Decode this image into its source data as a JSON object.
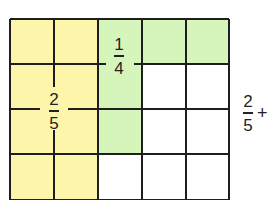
{
  "diagram": {
    "grid": {
      "rows": 4,
      "cols": 5
    },
    "colors": {
      "yellow": "#fdf6aa",
      "green": "#d6f5bb",
      "white": "#ffffff",
      "line": "#1e1e1e"
    },
    "shading": [
      [
        "yellow",
        "yellow",
        "green",
        "green",
        "green"
      ],
      [
        "yellow",
        "yellow",
        "green",
        "white",
        "white"
      ],
      [
        "yellow",
        "yellow",
        "green",
        "white",
        "white"
      ],
      [
        "yellow",
        "yellow",
        "white",
        "white",
        "white"
      ]
    ],
    "labels": {
      "quarter": {
        "numerator": "1",
        "denominator": "4"
      },
      "two_fifths": {
        "numerator": "2",
        "denominator": "5"
      }
    },
    "side_expression": {
      "numerator": "2",
      "denominator": "5",
      "operator": "+"
    }
  }
}
